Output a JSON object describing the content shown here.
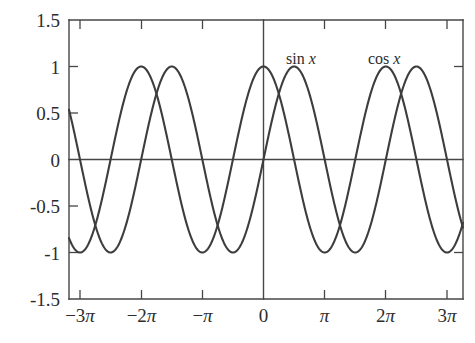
{
  "chart_data": {
    "type": "line",
    "title": "",
    "xlabel": "",
    "ylabel": "",
    "xlim": [
      -3.16,
      3.26
    ],
    "ylim": [
      -1.5,
      1.5
    ],
    "grid": false,
    "legend_position": "inline-above-curves",
    "x_tick_values": [
      -9.4248,
      -6.2832,
      -3.1416,
      0,
      3.1416,
      6.2832,
      9.4248
    ],
    "x_tick_labels": [
      "−3π",
      "−2π",
      "−π",
      "0",
      "π",
      "2π",
      "3π"
    ],
    "y_tick_values": [
      1.5,
      1,
      0.5,
      0,
      -0.5,
      -1,
      -1.5
    ],
    "y_tick_labels": [
      "1.5",
      "1",
      "0.5",
      "0",
      "-0.5",
      "-1",
      "-1.5"
    ],
    "series": [
      {
        "name": "sin x",
        "label_text": "sin ",
        "label_var": "x",
        "function": "sin",
        "color": "#3d3d3d",
        "amplitude": 1,
        "period": 6.283185307,
        "phase": 0,
        "label_x": 286,
        "label_y": 63,
        "sample_points": [
          {
            "x": -9.42,
            "y": 0.0
          },
          {
            "x": -7.85,
            "y": -1.0
          },
          {
            "x": -6.28,
            "y": 0.0
          },
          {
            "x": -4.71,
            "y": 1.0
          },
          {
            "x": -3.14,
            "y": 0.0
          },
          {
            "x": -1.57,
            "y": -1.0
          },
          {
            "x": 0.0,
            "y": 0.0
          },
          {
            "x": 1.57,
            "y": 1.0
          },
          {
            "x": 3.14,
            "y": 0.0
          },
          {
            "x": 4.71,
            "y": -1.0
          },
          {
            "x": 6.28,
            "y": 0.0
          },
          {
            "x": 7.85,
            "y": 1.0
          },
          {
            "x": 9.42,
            "y": 0.0
          }
        ]
      },
      {
        "name": "cos x",
        "label_text": "cos ",
        "label_var": "x",
        "function": "cos",
        "color": "#3d3d3d",
        "amplitude": 1,
        "period": 6.283185307,
        "phase": 1.570796327,
        "label_x": 368,
        "label_y": 63,
        "sample_points": [
          {
            "x": -9.42,
            "y": -1.0
          },
          {
            "x": -7.85,
            "y": 0.0
          },
          {
            "x": -6.28,
            "y": 1.0
          },
          {
            "x": -4.71,
            "y": 0.0
          },
          {
            "x": -3.14,
            "y": -1.0
          },
          {
            "x": -1.57,
            "y": 0.0
          },
          {
            "x": 0.0,
            "y": 1.0
          },
          {
            "x": 1.57,
            "y": 0.0
          },
          {
            "x": 3.14,
            "y": -1.0
          },
          {
            "x": 4.71,
            "y": 0.0
          },
          {
            "x": 6.28,
            "y": 1.0
          },
          {
            "x": 7.85,
            "y": 0.0
          },
          {
            "x": 9.42,
            "y": -1.0
          }
        ]
      }
    ],
    "axes_colors": {
      "frame": "#464646",
      "curve": "#3d3d3d",
      "text": "#2d2d2d",
      "background": "#ffffff"
    }
  },
  "labels": {
    "y_15": "1.5",
    "y_1": "1",
    "y_05": "0.5",
    "y_0": "0",
    "y_m05": "-0.5",
    "y_m1": "-1",
    "y_m15": "-1.5",
    "x_m3pi_sign": "−",
    "x_m3pi_num": "3",
    "x_m2pi_num": "2",
    "x_pi_num": "",
    "x_2pi_num": "2",
    "x_3pi_num": "3",
    "pi": "π",
    "x_zero": "0",
    "sin_label": "sin",
    "cos_label": "cos",
    "var_x": "x"
  }
}
